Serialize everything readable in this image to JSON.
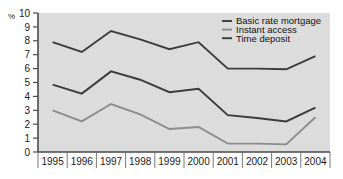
{
  "chart_data": {
    "type": "line",
    "title": "",
    "xlabel": "",
    "ylabel": "%",
    "ylim": [
      0,
      10
    ],
    "ytick_labels": [
      "0",
      "1",
      "2",
      "3",
      "4",
      "5",
      "6",
      "7",
      "8",
      "9",
      "10"
    ],
    "grid": false,
    "legend_position": "top-right",
    "categories": [
      "1995",
      "1996",
      "1997",
      "1998",
      "1999",
      "2000",
      "2001",
      "2002",
      "2003",
      "2004"
    ],
    "series": [
      {
        "name": "Basic rate mortgage",
        "color": "#3b3b3b",
        "values": [
          7.9,
          7.2,
          8.7,
          8.1,
          7.4,
          7.9,
          6.0,
          6.0,
          5.95,
          6.9
        ]
      },
      {
        "name": "Instant access",
        "color": "#8c8c8c",
        "values": [
          3.0,
          2.2,
          3.45,
          2.7,
          1.65,
          1.8,
          0.6,
          0.6,
          0.55,
          2.5
        ]
      },
      {
        "name": "Time deposit",
        "color": "#3b3b3b",
        "values": [
          4.85,
          4.2,
          5.8,
          5.2,
          4.3,
          4.55,
          2.65,
          2.45,
          2.2,
          3.2
        ]
      }
    ]
  },
  "legend": {
    "entries": [
      {
        "label": "Basic rate mortgage",
        "swatch": "legend-swatch-basic-rate-mortgage"
      },
      {
        "label": "Instant access",
        "swatch": "legend-swatch-instant-access"
      },
      {
        "label": "Time deposit",
        "swatch": "legend-swatch-time-deposit"
      }
    ]
  },
  "colors": {
    "plot_background": "#dcdcdc",
    "axis": "#4a4a4a",
    "text": "#1a1a1a",
    "dark_series": "#3b3b3b",
    "light_series": "#8c8c8c"
  }
}
